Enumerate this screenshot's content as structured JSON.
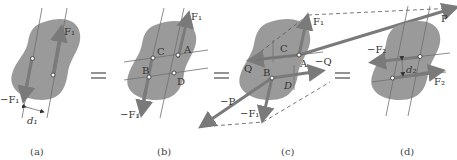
{
  "figure": {
    "panels": [
      {
        "id": "a",
        "caption": "(a)",
        "forces": [
          {
            "label": "F₁",
            "direction": "up"
          },
          {
            "label": "−F₁",
            "direction": "down"
          }
        ],
        "distance_label": "d₁"
      },
      {
        "id": "b",
        "caption": "(b)",
        "forces": [
          {
            "label": "F₁",
            "direction": "up"
          },
          {
            "label": "−F₁",
            "direction": "down"
          }
        ],
        "points": [
          "A",
          "B",
          "C",
          "D"
        ]
      },
      {
        "id": "c",
        "caption": "(c)",
        "forces": [
          {
            "label": "F₁",
            "direction": "up"
          },
          {
            "label": "−F₁",
            "direction": "down"
          },
          {
            "label": "P",
            "direction": "up-right"
          },
          {
            "label": "−P",
            "direction": "down-left"
          },
          {
            "label": "Q",
            "direction": "left"
          },
          {
            "label": "−Q",
            "direction": "right"
          }
        ],
        "points": [
          "A",
          "B",
          "C",
          "D"
        ]
      },
      {
        "id": "d",
        "caption": "(d)",
        "forces": [
          {
            "label": "−F₂",
            "direction": "left"
          },
          {
            "label": "F₂",
            "direction": "right"
          }
        ],
        "distance_label": "d₂"
      }
    ],
    "equals_sign": "="
  },
  "labels": {
    "a_F1": "F₁",
    "a_negF1": "−F₁",
    "a_d1": "d₁",
    "b_F1": "F₁",
    "b_negF1": "−F₁",
    "b_A": "A",
    "b_B": "B",
    "b_C": "C",
    "b_D": "D",
    "c_F1": "F₁",
    "c_negF1": "−F₁",
    "c_P": "P",
    "c_negP": "−P",
    "c_Q": "Q",
    "c_negQ": "−Q",
    "c_A": "A",
    "c_B": "B",
    "c_C": "C",
    "c_D": "D",
    "d_negF2": "−F₂",
    "d_F2": "F₂",
    "d_d2": "d₂"
  },
  "captions": {
    "a": "(a)",
    "b": "(b)",
    "c": "(c)",
    "d": "(d)"
  },
  "colors": {
    "body_fill": "#9a9a9a",
    "force_arrow": "#7a7a7a",
    "line": "#6e6e6e",
    "background": "#ffffff"
  }
}
